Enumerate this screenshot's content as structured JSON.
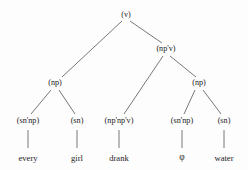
{
  "figure": {
    "type": "syntax-tree",
    "title": "",
    "background_color": "#fdfdfd",
    "line_color": "#555555",
    "text_color": "#1c1c1c"
  },
  "nodes": [
    {
      "id": "root",
      "label": "(v)",
      "kind": "category",
      "x": 126,
      "y": 15
    },
    {
      "id": "npv",
      "label": "(np'v)",
      "kind": "category",
      "x": 166,
      "y": 49
    },
    {
      "id": "np_left",
      "label": "(np)",
      "kind": "category",
      "x": 55,
      "y": 83
    },
    {
      "id": "np_right",
      "label": "(np)",
      "kind": "category",
      "x": 199,
      "y": 83
    },
    {
      "id": "snnp_1",
      "label": "(sn'np)",
      "kind": "category",
      "x": 28,
      "y": 121
    },
    {
      "id": "sn_1",
      "label": "(sn)",
      "kind": "category",
      "x": 77,
      "y": 121
    },
    {
      "id": "npnpv",
      "label": "(np'np'v)",
      "kind": "category",
      "x": 119,
      "y": 121
    },
    {
      "id": "snnp_2",
      "label": "(sn'np)",
      "kind": "category",
      "x": 182,
      "y": 121
    },
    {
      "id": "sn_2",
      "label": "(sn)",
      "kind": "category",
      "x": 224,
      "y": 121
    },
    {
      "id": "w_every",
      "label": "every",
      "kind": "word",
      "x": 28,
      "y": 158
    },
    {
      "id": "w_girl",
      "label": "girl",
      "kind": "word",
      "x": 77,
      "y": 158
    },
    {
      "id": "w_drank",
      "label": "drank",
      "kind": "word",
      "x": 119,
      "y": 158
    },
    {
      "id": "w_phi",
      "label": "φ",
      "kind": "phi",
      "x": 182,
      "y": 158
    },
    {
      "id": "w_water",
      "label": "water",
      "kind": "word",
      "x": 224,
      "y": 158
    }
  ],
  "edges": [
    {
      "from": "root",
      "to": "np_left",
      "x1": 122,
      "y1": 21,
      "x2": 62,
      "y2": 77
    },
    {
      "from": "root",
      "to": "npv",
      "x1": 130,
      "y1": 21,
      "x2": 162,
      "y2": 43
    },
    {
      "from": "npv",
      "to": "npnpv",
      "x1": 163,
      "y1": 56,
      "x2": 124,
      "y2": 114
    },
    {
      "from": "npv",
      "to": "np_right",
      "x1": 170,
      "y1": 56,
      "x2": 196,
      "y2": 77
    },
    {
      "from": "np_left",
      "to": "snnp_1",
      "x1": 51,
      "y1": 90,
      "x2": 31,
      "y2": 114
    },
    {
      "from": "np_left",
      "to": "sn_1",
      "x1": 59,
      "y1": 90,
      "x2": 75,
      "y2": 114
    },
    {
      "from": "np_right",
      "to": "snnp_2",
      "x1": 195,
      "y1": 90,
      "x2": 184,
      "y2": 114
    },
    {
      "from": "np_right",
      "to": "sn_2",
      "x1": 203,
      "y1": 90,
      "x2": 221,
      "y2": 114
    },
    {
      "from": "snnp_1",
      "to": "w_every",
      "x1": 28,
      "y1": 130,
      "x2": 28,
      "y2": 148
    },
    {
      "from": "sn_1",
      "to": "w_girl",
      "x1": 77,
      "y1": 130,
      "x2": 77,
      "y2": 148
    },
    {
      "from": "npnpv",
      "to": "w_drank",
      "x1": 119,
      "y1": 130,
      "x2": 119,
      "y2": 148
    },
    {
      "from": "snnp_2",
      "to": "w_phi",
      "x1": 182,
      "y1": 130,
      "x2": 182,
      "y2": 148
    },
    {
      "from": "sn_2",
      "to": "w_water",
      "x1": 224,
      "y1": 130,
      "x2": 224,
      "y2": 148
    }
  ]
}
